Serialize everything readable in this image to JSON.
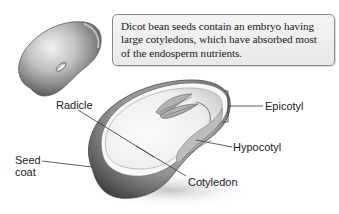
{
  "callout": {
    "text": "Dicot bean seeds contain an embryo having large cotyledons, which have absorbed most of the endosperm nutrients."
  },
  "labels": {
    "radicle": "Radicle",
    "seed_coat": "Seed coat",
    "epicotyl": "Epicotyl",
    "hypocotyl": "Hypocotyl",
    "cotyledon": "Cotyledon"
  },
  "illustrations": {
    "whole_seed": "whole-bean-seed",
    "cross_section": "bean-seed-cross-section"
  },
  "colors": {
    "background": "#ffffff",
    "callout_fill": "#eeeeee",
    "callout_border": "#8a8a8a",
    "leader_line": "#333333",
    "seed_dark": "#5a5a5a",
    "seed_mid": "#9a9a9a",
    "seed_light": "#ececec"
  }
}
